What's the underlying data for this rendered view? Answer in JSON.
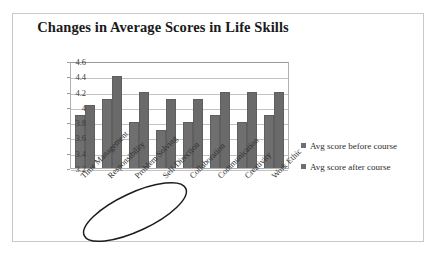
{
  "chart_data": {
    "type": "bar",
    "title": "Changes in Average Scores in Life Skills",
    "xlabel": "",
    "ylabel": "",
    "ylim": [
      3.2,
      4.6
    ],
    "yticks": [
      "4.6",
      "4.4",
      "4.2",
      "4",
      "3.8",
      "3.6",
      "3.4",
      "3.2"
    ],
    "grid": true,
    "legend_position": "right",
    "categories": [
      "Time Management",
      "Responsibility",
      "Problem Solving",
      "Self-Direction",
      "Collaboration",
      "Communication",
      "Creativity",
      "Work Ethic"
    ],
    "series": [
      {
        "name": "Avg score before course",
        "color": "#6f6f6f",
        "values": [
          3.9,
          4.1,
          3.8,
          3.7,
          3.8,
          3.9,
          3.8,
          3.9
        ]
      },
      {
        "name": "Avg score after course",
        "color": "#6a6a6a",
        "values": [
          4.02,
          4.4,
          4.2,
          4.1,
          4.1,
          4.2,
          4.2,
          4.2
        ]
      }
    ],
    "annotations": [
      {
        "name": "handdrawn-ellipse",
        "target": "Problem Solving",
        "shape": "ellipse",
        "color": "#1a1a1a"
      }
    ]
  },
  "legend": {
    "items": [
      {
        "label": "Avg score before course"
      },
      {
        "label": "Avg score after course"
      }
    ]
  }
}
